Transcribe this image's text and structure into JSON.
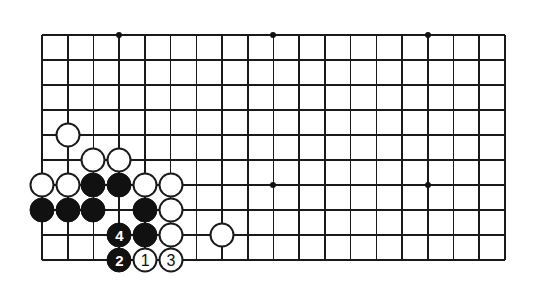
{
  "figure": {
    "kind": "go-board-diagram",
    "width": 535,
    "height": 289,
    "background_color": "#ffffff",
    "line_color": "#1a1a1a",
    "black_stone_color": "#111111",
    "white_stone_color": "#ffffff"
  },
  "board": {
    "columns": 19,
    "rows": 10,
    "origin_x": 42,
    "origin_y": 35,
    "col_spacing": 25.72,
    "row_spacing": 25.0,
    "stone_diameter": 25,
    "cropped_view": "bottom-left corner region of a 19x19 board, showing 10 lines from the top edge of the crop down to the bottom board edge",
    "star_points": [
      {
        "col": 3,
        "row": 0
      },
      {
        "col": 9,
        "row": 0
      },
      {
        "col": 15,
        "row": 0
      },
      {
        "col": 9,
        "row": 6
      },
      {
        "col": 15,
        "row": 6
      }
    ]
  },
  "stones": [
    {
      "color": "white",
      "col": 1,
      "row": 4,
      "label": ""
    },
    {
      "color": "white",
      "col": 2,
      "row": 5,
      "label": ""
    },
    {
      "color": "white",
      "col": 3,
      "row": 5,
      "label": ""
    },
    {
      "color": "white",
      "col": 0,
      "row": 6,
      "label": ""
    },
    {
      "color": "white",
      "col": 1,
      "row": 6,
      "label": ""
    },
    {
      "color": "black",
      "col": 2,
      "row": 6,
      "label": ""
    },
    {
      "color": "black",
      "col": 3,
      "row": 6,
      "label": ""
    },
    {
      "color": "white",
      "col": 4,
      "row": 6,
      "label": ""
    },
    {
      "color": "white",
      "col": 5,
      "row": 6,
      "label": ""
    },
    {
      "color": "black",
      "col": 0,
      "row": 7,
      "label": ""
    },
    {
      "color": "black",
      "col": 1,
      "row": 7,
      "label": ""
    },
    {
      "color": "black",
      "col": 2,
      "row": 7,
      "label": ""
    },
    {
      "color": "black",
      "col": 4,
      "row": 7,
      "label": ""
    },
    {
      "color": "white",
      "col": 5,
      "row": 7,
      "label": ""
    },
    {
      "color": "black",
      "col": 3,
      "row": 8,
      "label": "4"
    },
    {
      "color": "black",
      "col": 4,
      "row": 8,
      "label": ""
    },
    {
      "color": "white",
      "col": 5,
      "row": 8,
      "label": ""
    },
    {
      "color": "white",
      "col": 7,
      "row": 8,
      "label": ""
    },
    {
      "color": "black",
      "col": 3,
      "row": 9,
      "label": "2"
    },
    {
      "color": "white",
      "col": 4,
      "row": 9,
      "label": "1"
    },
    {
      "color": "white",
      "col": 5,
      "row": 9,
      "label": "3"
    }
  ],
  "move_sequence": [
    {
      "number": "1",
      "color": "white",
      "col": 4,
      "row": 9
    },
    {
      "number": "2",
      "color": "black",
      "col": 3,
      "row": 9
    },
    {
      "number": "3",
      "color": "white",
      "col": 5,
      "row": 9
    },
    {
      "number": "4",
      "color": "black",
      "col": 3,
      "row": 8
    }
  ]
}
